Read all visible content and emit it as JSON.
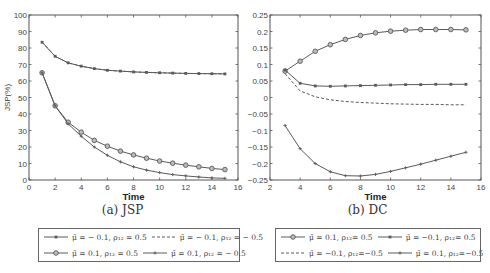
{
  "chart_data": [
    {
      "type": "line",
      "title": "",
      "caption": "(a) JSP",
      "xlabel": "Time",
      "ylabel": "JSP(%)",
      "xlim": [
        0,
        16
      ],
      "ylim": [
        0,
        100
      ],
      "xticks": [
        0,
        2,
        4,
        6,
        8,
        10,
        12,
        14,
        16
      ],
      "yticks": [
        0,
        10,
        20,
        30,
        40,
        50,
        60,
        70,
        80,
        90,
        100
      ],
      "grid": false,
      "legend_position": "below",
      "x": [
        1,
        2,
        3,
        4,
        5,
        6,
        7,
        8,
        9,
        10,
        11,
        12,
        13,
        14,
        15
      ],
      "series": [
        {
          "name": "μ̃ = −0.1, ρ12 = 0.5",
          "style": "solid-dot",
          "values": [
            83.5,
            75,
            71,
            69,
            67.5,
            66.5,
            66,
            65.5,
            65.2,
            65,
            64.8,
            64.6,
            64.5,
            64.4,
            64.3
          ]
        },
        {
          "name": "μ̃ = −0.1, ρ12 = −0.5",
          "style": "dashed",
          "values": [
            83.5,
            75,
            71,
            69,
            67.5,
            66.5,
            66,
            65.5,
            65.2,
            65,
            64.8,
            64.6,
            64.5,
            64.4,
            64.3
          ]
        },
        {
          "name": "μ̃ = 0.1, ρ12 = 0.5",
          "style": "solid-circle",
          "values": [
            65,
            45,
            35,
            29,
            24,
            20.5,
            17.5,
            15.2,
            13.2,
            11.5,
            10.2,
            9,
            8,
            7,
            6.3
          ]
        },
        {
          "name": "μ̃ = 0.1, ρ12 = −0.5",
          "style": "solid-star",
          "values": [
            65,
            45,
            34,
            26.5,
            20,
            15,
            11,
            8,
            6,
            4.5,
            3.3,
            2.5,
            1.8,
            1.3,
            1
          ]
        }
      ]
    },
    {
      "type": "line",
      "title": "",
      "caption": "(b) DC",
      "xlabel": "Time",
      "ylabel": "",
      "xlim": [
        2,
        16
      ],
      "ylim": [
        -0.25,
        0.25
      ],
      "xticks": [
        2,
        4,
        6,
        8,
        10,
        12,
        14,
        16
      ],
      "yticks": [
        -0.25,
        -0.2,
        -0.15,
        -0.1,
        -0.05,
        0,
        0.05,
        0.1,
        0.15,
        0.2,
        0.25
      ],
      "grid": false,
      "legend_position": "below",
      "x": [
        3,
        4,
        5,
        6,
        7,
        8,
        9,
        10,
        11,
        12,
        13,
        14,
        15
      ],
      "series": [
        {
          "name": "μ̃ = 0.1, ρ12 = 0.5",
          "style": "solid-circle",
          "values": [
            0.08,
            0.11,
            0.14,
            0.16,
            0.176,
            0.188,
            0.196,
            0.201,
            0.204,
            0.206,
            0.206,
            0.206,
            0.205
          ]
        },
        {
          "name": "μ̃ = −0.1, ρ12 = 0.5",
          "style": "solid-dot",
          "values": [
            0.083,
            0.043,
            0.035,
            0.034,
            0.035,
            0.036,
            0.037,
            0.038,
            0.039,
            0.039,
            0.04,
            0.04,
            0.04
          ]
        },
        {
          "name": "μ̃ = −0.1, ρ12 = −0.5",
          "style": "dashed",
          "values": [
            0.072,
            0.02,
            0.002,
            -0.007,
            -0.012,
            -0.015,
            -0.017,
            -0.019,
            -0.02,
            -0.021,
            -0.021,
            -0.022,
            -0.022
          ]
        },
        {
          "name": "μ̃ = 0.1, ρ12 = −0.5",
          "style": "solid-star",
          "values": [
            -0.085,
            -0.155,
            -0.2,
            -0.225,
            -0.237,
            -0.238,
            -0.233,
            -0.224,
            -0.213,
            -0.202,
            -0.19,
            -0.178,
            -0.166
          ]
        }
      ]
    }
  ],
  "figures": {
    "a": {
      "caption": "(a) JSP",
      "xlabel": "Time",
      "ylabel": "JSP(%)",
      "legend": [
        [
          "μ̃ = − 0.1, ρ₁₂ = 0.5",
          "μ̃ = − 0.1, ρ₁₂ = − 0.5"
        ],
        [
          "μ̃ = 0.1, ρ₁₂ = 0.5",
          "μ̃ = 0.1, ρ₁₂ = − 0.5"
        ]
      ]
    },
    "b": {
      "caption": "(b) DC",
      "xlabel": "Time",
      "legend": [
        [
          "μ̃ = 0.1, ρ₁₂= 0.5",
          "μ̃ = −0.1, ρ₁₂= 0.5"
        ],
        [
          "μ̃ = −0.1, ρ₁₂=−0.5",
          "μ̃ = 0.1, ρ₁₂=−0.5"
        ]
      ]
    }
  },
  "colors": {
    "axis": "#555555",
    "line": "#5a5a5a",
    "text": "#333333"
  }
}
